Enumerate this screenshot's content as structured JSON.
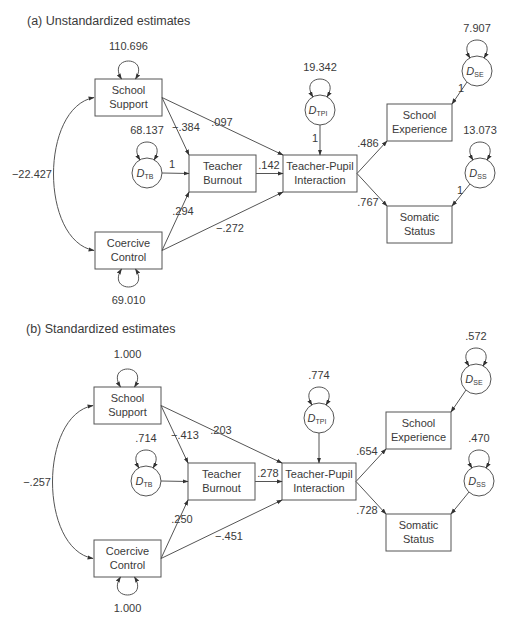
{
  "panels": [
    {
      "id": "a",
      "title": "(a)  Unstandardized estimates",
      "offset_x": 0,
      "offset_y": 0,
      "variances": {
        "school_support": "110.696",
        "coercive_control": "69.010",
        "d_tb": "68.137",
        "d_tpi": "19.342",
        "d_se": "7.907",
        "d_ss": "13.073"
      },
      "covariance": "−22.427",
      "paths": {
        "ss_to_tb": "−.384",
        "ss_to_tpi": ".097",
        "cc_to_tb": ".294",
        "cc_to_tpi": "−.272",
        "tb_to_tpi": ".142",
        "tpi_to_se": ".486",
        "tpi_to_ss": ".767",
        "dtb_to_tb": "1",
        "dtpi_to_tpi": "1",
        "dse_to_se": "1",
        "dss_to_ss": "1"
      }
    },
    {
      "id": "b",
      "title": "(b)  Standardized estimates",
      "offset_x": -1,
      "offset_y": 308,
      "variances": {
        "school_support": "1.000",
        "coercive_control": "1.000",
        "d_tb": ".714",
        "d_tpi": ".774",
        "d_se": ".572",
        "d_ss": ".470"
      },
      "covariance": "−.257",
      "paths": {
        "ss_to_tb": "−.413",
        "ss_to_tpi": ".203",
        "cc_to_tb": ".250",
        "cc_to_tpi": "−.451",
        "tb_to_tpi": ".278",
        "tpi_to_se": ".654",
        "tpi_to_ss": ".728",
        "dtb_to_tb": "",
        "dtpi_to_tpi": "",
        "dse_to_se": "",
        "dss_to_ss": ""
      }
    }
  ],
  "nodes": {
    "school_support": [
      "School",
      "Support"
    ],
    "coercive_control": [
      "Coercive",
      "Control"
    ],
    "teacher_burnout": [
      "Teacher",
      "Burnout"
    ],
    "tpi": [
      "Teacher-Pupil",
      "Interaction"
    ],
    "school_experience": [
      "School",
      "Experience"
    ],
    "somatic_status": [
      "Somatic",
      "Status"
    ]
  },
  "disturbances": {
    "d_tb": {
      "main": "D",
      "sub": "TB"
    },
    "d_tpi": {
      "main": "D",
      "sub": "TPI"
    },
    "d_se": {
      "main": "D",
      "sub": "SE"
    },
    "d_ss": {
      "main": "D",
      "sub": "SS"
    }
  },
  "colors": {
    "line": "#555555",
    "text": "#3a3a3a",
    "background": "#ffffff"
  }
}
